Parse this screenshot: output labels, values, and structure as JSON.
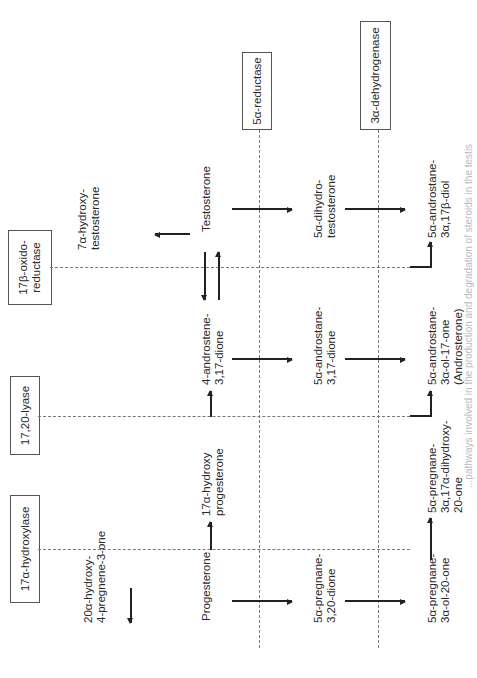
{
  "orientation": "rotated-90-ccw",
  "enzymes": {
    "hydroxylase": "17α-hydroxylase",
    "lyase": "17,20-lyase",
    "oxidoreductase_l1": "17β-oxido-",
    "oxidoreductase_l2": "reductase",
    "reductase": "5α-reductase",
    "dehydrogenase": "3α-dehydrogenase"
  },
  "compounds": {
    "c20a_l1": "20α-hydroxy-",
    "c20a_l2": "4-pregnene-3-one",
    "c7a_l1": "7α-hydroxy-",
    "c7a_l2": "testosterone",
    "progesterone": "Progesterone",
    "ohprog_l1": "17α-hydroxy",
    "ohprog_l2": "progesterone",
    "androstenedione_l1": "4-androstene-",
    "androstenedione_l2": "3,17-dione",
    "testosterone": "Testosterone",
    "pregnanedione_l1": "5α-pregnane-",
    "pregnanedione_l2": "3,20-dione",
    "androstanedione_l1": "5α-androstane-",
    "androstanedione_l2": "3,17-dione",
    "dht_l1": "5α-dihydro-",
    "dht_l2": "testosterone",
    "pregnanolone_l1": "5α-pregnane-",
    "pregnanolone_l2": "3α-ol-20-one",
    "pregnanediol_l1": "5α-pregnane-",
    "pregnanediol_l2": "3α,17α-dihydroxy-",
    "pregnanediol_l3": "20-one",
    "androsterone_l1": "5α-androstane-",
    "androsterone_l2": "3α-ol-17-one",
    "androsterone_l3": "(Androsterone)",
    "androstanediol_l1": "5α-androstane-",
    "androstanediol_l2": "3α,17β-diol"
  },
  "caption": "...pathways involved in the production and degradation of steroids in the testis"
}
